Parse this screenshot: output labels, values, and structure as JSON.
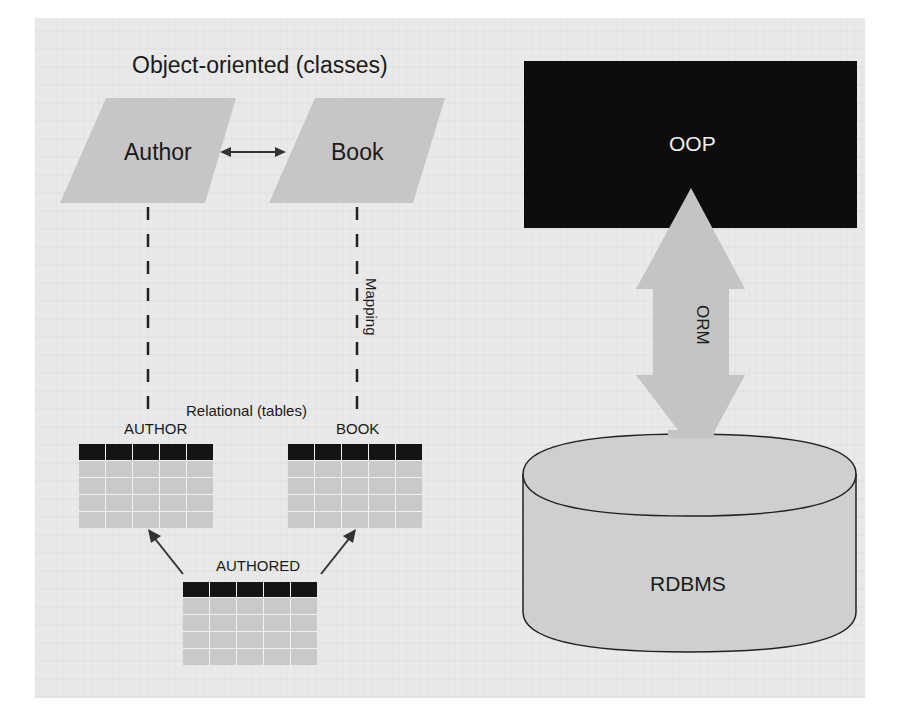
{
  "diagram": {
    "object_oriented_title": "Object-oriented (classes)",
    "classes": [
      {
        "name": "Author"
      },
      {
        "name": "Book"
      }
    ],
    "association_arrow": "bidirectional",
    "mapping_label": "Mapping",
    "relational_title": "Relational (tables)",
    "tables": [
      {
        "name": "AUTHOR",
        "columns": 5,
        "rows": 4
      },
      {
        "name": "BOOK",
        "columns": 5,
        "rows": 4
      },
      {
        "name": "AUTHORED",
        "columns": 5,
        "rows": 4
      }
    ],
    "oop_box_label": "OOP",
    "orm_arrow_label": "ORM",
    "database_label": "RDBMS",
    "colors": {
      "class_fill": "#c6c6c6",
      "oop_box_fill": "#0d0d0d",
      "arrow_fill": "#c4c4c4",
      "db_fill": "#cfcfcf",
      "table_header": "#141414",
      "table_cell": "#c9c9c9",
      "background": "#e9e9e9"
    }
  }
}
